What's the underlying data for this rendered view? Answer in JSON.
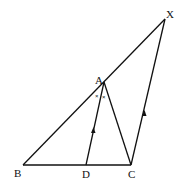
{
  "diagram": {
    "type": "geometry",
    "points": {
      "B": {
        "label": "B",
        "x": 23,
        "y": 165
      },
      "D": {
        "label": "D",
        "x": 86,
        "y": 165
      },
      "C": {
        "label": "C",
        "x": 131,
        "y": 165
      },
      "A": {
        "label": "A",
        "x": 104,
        "y": 82
      },
      "X": {
        "label": "X",
        "x": 165,
        "y": 19
      }
    },
    "segments": [
      [
        "B",
        "X"
      ],
      [
        "B",
        "C"
      ],
      [
        "A",
        "D"
      ],
      [
        "A",
        "C"
      ],
      [
        "C",
        "X"
      ]
    ],
    "parallel_marks": [
      "DA",
      "CX"
    ],
    "angle_marks": {
      "symbol": "×",
      "count": 2,
      "at": "A"
    }
  }
}
